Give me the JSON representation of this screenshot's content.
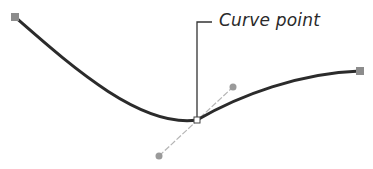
{
  "diagram": {
    "callout_label": "Curve point",
    "colors": {
      "curve": "#2b2b2b",
      "anchor": "#8c8c8c",
      "handle": "#9a9a9a",
      "handle_line": "#b0b0b0",
      "callout_line": "#333333"
    },
    "points": {
      "start_anchor": [
        15,
        17
      ],
      "curve_point": [
        197,
        120
      ],
      "end_anchor": [
        360,
        71
      ],
      "handle_in": [
        159,
        156
      ],
      "handle_out": [
        233,
        87
      ]
    }
  }
}
